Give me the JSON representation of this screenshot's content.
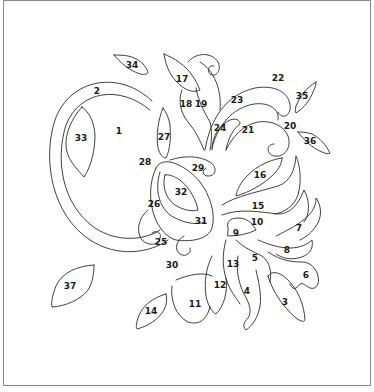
{
  "page": {
    "type": "color-by-number line art",
    "border_color": "#8a8a8a",
    "line_color": "#2a2a2a",
    "background": "#ffffff"
  },
  "labels": [
    {
      "id": "1",
      "text": "1",
      "x": 119,
      "y": 131,
      "region": "circle-interior"
    },
    {
      "id": "2",
      "text": "2",
      "x": 97,
      "y": 91,
      "region": "circle-ring"
    },
    {
      "id": "3",
      "text": "3",
      "x": 285,
      "y": 302,
      "region": "lower-right-leaf"
    },
    {
      "id": "4",
      "text": "4",
      "x": 247,
      "y": 291,
      "region": "wavy-petal"
    },
    {
      "id": "5",
      "text": "5",
      "x": 255,
      "y": 258,
      "region": "petal"
    },
    {
      "id": "6",
      "text": "6",
      "x": 306,
      "y": 275,
      "region": "wavy-petal"
    },
    {
      "id": "7",
      "text": "7",
      "x": 299,
      "y": 228,
      "region": "wavy-petal"
    },
    {
      "id": "8",
      "text": "8",
      "x": 287,
      "y": 250,
      "region": "petal"
    },
    {
      "id": "9",
      "text": "9",
      "x": 236,
      "y": 233,
      "region": "petal-base"
    },
    {
      "id": "10",
      "text": "10",
      "x": 257,
      "y": 222,
      "region": "petal"
    },
    {
      "id": "11",
      "text": "11",
      "x": 195,
      "y": 304,
      "region": "petal"
    },
    {
      "id": "12",
      "text": "12",
      "x": 220,
      "y": 285,
      "region": "petal"
    },
    {
      "id": "13",
      "text": "13",
      "x": 233,
      "y": 264,
      "region": "petal"
    },
    {
      "id": "14",
      "text": "14",
      "x": 151,
      "y": 311,
      "region": "leaf"
    },
    {
      "id": "15",
      "text": "15",
      "x": 258,
      "y": 206,
      "region": "petal"
    },
    {
      "id": "16",
      "text": "16",
      "x": 260,
      "y": 175,
      "region": "leaf"
    },
    {
      "id": "17",
      "text": "17",
      "x": 182,
      "y": 79,
      "region": "leaf"
    },
    {
      "id": "18",
      "text": "18",
      "x": 186,
      "y": 104,
      "region": "stem-curl"
    },
    {
      "id": "19",
      "text": "19",
      "x": 201,
      "y": 104,
      "region": "stem-curl"
    },
    {
      "id": "20",
      "text": "20",
      "x": 290,
      "y": 126,
      "region": "curl"
    },
    {
      "id": "21",
      "text": "21",
      "x": 248,
      "y": 130,
      "region": "curl"
    },
    {
      "id": "22",
      "text": "22",
      "x": 278,
      "y": 78,
      "region": "curl-outer"
    },
    {
      "id": "23",
      "text": "23",
      "x": 237,
      "y": 100,
      "region": "curl"
    },
    {
      "id": "24",
      "text": "24",
      "x": 220,
      "y": 128,
      "region": "curl"
    },
    {
      "id": "25",
      "text": "25",
      "x": 161,
      "y": 242,
      "region": "paisley-curl"
    },
    {
      "id": "26",
      "text": "26",
      "x": 154,
      "y": 204,
      "region": "paisley"
    },
    {
      "id": "27",
      "text": "27",
      "x": 164,
      "y": 137,
      "region": "leaf"
    },
    {
      "id": "28",
      "text": "28",
      "x": 145,
      "y": 162,
      "region": "paisley-outer"
    },
    {
      "id": "29",
      "text": "29",
      "x": 198,
      "y": 168,
      "region": "paisley-top"
    },
    {
      "id": "30",
      "text": "30",
      "x": 172,
      "y": 265,
      "region": "curl"
    },
    {
      "id": "31",
      "text": "31",
      "x": 201,
      "y": 221,
      "region": "paisley-band"
    },
    {
      "id": "32",
      "text": "32",
      "x": 181,
      "y": 192,
      "region": "paisley-center"
    },
    {
      "id": "33",
      "text": "33",
      "x": 81,
      "y": 138,
      "region": "leaf"
    },
    {
      "id": "34",
      "text": "34",
      "x": 132,
      "y": 65,
      "region": "leaf"
    },
    {
      "id": "35",
      "text": "35",
      "x": 302,
      "y": 96,
      "region": "leaf"
    },
    {
      "id": "36",
      "text": "36",
      "x": 310,
      "y": 141,
      "region": "leaf"
    },
    {
      "id": "37",
      "text": "37",
      "x": 70,
      "y": 286,
      "region": "leaf"
    }
  ]
}
